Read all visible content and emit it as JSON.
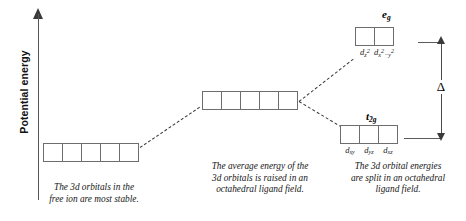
{
  "diagram": {
    "axis": {
      "label": "Potential energy",
      "arrow_icon": "up-arrow-icon"
    },
    "levels": {
      "free_ion": {
        "name": "free ion 3d level",
        "box_count": 5,
        "boxes": [
          "",
          "",
          "",
          "",
          ""
        ],
        "caption_lines": [
          "The 3d orbitals in the",
          "free ion are most stable."
        ]
      },
      "spherical_average": {
        "name": "average 3d level in octahedral field",
        "box_count": 5,
        "boxes": [
          "",
          "",
          "",
          "",
          ""
        ],
        "caption_lines": [
          "The average energy of the",
          "3d orbitals is raised in an",
          "octahedral ligand field."
        ]
      },
      "eg": {
        "set_label": "e",
        "set_label_sub": "g",
        "orbitals": [
          {
            "base": "d",
            "sub": "z",
            "sup": "2"
          },
          {
            "base": "d",
            "sub": "x",
            "sup": "2",
            "tail": "−y",
            "tail_sup": "2"
          }
        ]
      },
      "t2g": {
        "set_label": "t",
        "set_label_sub": "2g",
        "orbitals": [
          {
            "base": "d",
            "sub": "xy"
          },
          {
            "base": "d",
            "sub": "yz"
          },
          {
            "base": "d",
            "sub": "xz"
          }
        ]
      },
      "split": {
        "caption_lines": [
          "The 3d orbital energies",
          "are split in an octahedral",
          "ligand field."
        ]
      }
    },
    "splitting": {
      "symbol": "Δ",
      "name": "crystal-field-splitting-energy"
    },
    "colors": {
      "background": "#ffffff",
      "box_border": "#6d6d6d",
      "line": "#3b3b3b",
      "text": "#161616"
    }
  }
}
